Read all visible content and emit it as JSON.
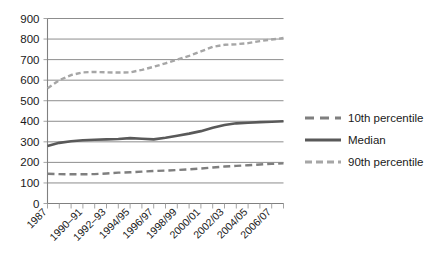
{
  "chart_data": {
    "type": "line",
    "title": "",
    "subtitle": "",
    "xlabel": "",
    "ylabel": "",
    "ylim": [
      0,
      900
    ],
    "ytick_step": 100,
    "yticks": [
      "0",
      "100",
      "200",
      "300",
      "400",
      "500",
      "600",
      "700",
      "800",
      "900"
    ],
    "grid": true,
    "legend_position": "right",
    "x": [
      "1987",
      "1988-89",
      "1989-90",
      "1990-91",
      "1991-92",
      "1992-93",
      "1993-94",
      "1994/95",
      "1995/96",
      "1996/97",
      "1997/98",
      "1998/99",
      "1999/00",
      "2000/01",
      "2001/02",
      "2002/03",
      "2003/04",
      "2004/05",
      "2005/06",
      "2006/07",
      "2007/08"
    ],
    "xtick_labels": [
      "1987",
      "1990–91",
      "1992–93",
      "1994/95",
      "1996/97",
      "1998/99",
      "2000/01",
      "2002/03",
      "2004/05",
      "2006/07"
    ],
    "xtick_label_indices": [
      0,
      3,
      5,
      7,
      9,
      11,
      13,
      15,
      17,
      19
    ],
    "series": [
      {
        "name": "10th percentile",
        "style": "dashed-long",
        "color": "#7f7f7f",
        "values": [
          145,
          143,
          142,
          142,
          143,
          146,
          150,
          152,
          155,
          158,
          160,
          163,
          166,
          170,
          175,
          180,
          183,
          186,
          190,
          193,
          195
        ]
      },
      {
        "name": "Median",
        "style": "solid",
        "color": "#595959",
        "values": [
          280,
          295,
          303,
          308,
          310,
          312,
          314,
          318,
          315,
          312,
          320,
          330,
          340,
          352,
          368,
          382,
          390,
          393,
          396,
          398,
          400
        ]
      },
      {
        "name": "90th percentile",
        "style": "dashed-short",
        "color": "#a6a6a6",
        "values": [
          560,
          600,
          625,
          638,
          640,
          638,
          637,
          638,
          650,
          665,
          682,
          700,
          718,
          740,
          762,
          772,
          775,
          780,
          790,
          798,
          805
        ]
      }
    ]
  },
  "legend": {
    "items": [
      {
        "label": "10th percentile"
      },
      {
        "label": "Median"
      },
      {
        "label": "90th percentile"
      }
    ]
  }
}
